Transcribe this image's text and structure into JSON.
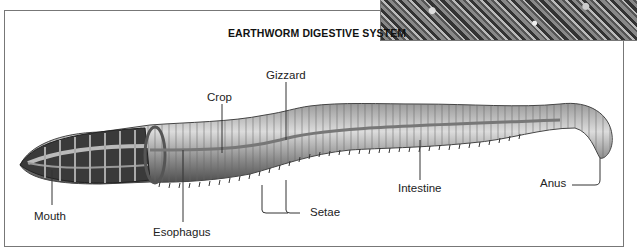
{
  "diagram": {
    "title": "EARTHWORM DIGESTIVE SYSTEM",
    "labels": {
      "mouth": "Mouth",
      "esophagus": "Esophagus",
      "crop": "Crop",
      "gizzard": "Gizzard",
      "setae": "Setae",
      "intestine": "Intestine",
      "anus": "Anus"
    },
    "colors": {
      "frame": "#777777",
      "text": "#222222",
      "worm_dark": "#555555",
      "worm_light": "#cfcfcf"
    }
  }
}
